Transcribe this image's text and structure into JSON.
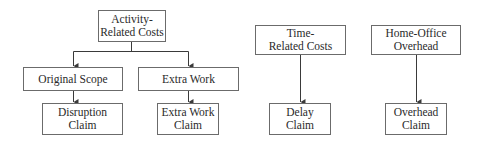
{
  "diagram": {
    "colors": {
      "line": "#3a3a3a",
      "border": "#6b6b6b",
      "text": "#2a2a2a",
      "background": "#ffffff"
    },
    "nodes": {
      "activity": {
        "lines": [
          "Activity-",
          "Related Costs"
        ]
      },
      "original_scope": {
        "lines": [
          "Original Scope"
        ]
      },
      "extra_work": {
        "lines": [
          "Extra Work"
        ]
      },
      "disruption_claim": {
        "lines": [
          "Disruption",
          "Claim"
        ]
      },
      "extra_work_claim": {
        "lines": [
          "Extra Work",
          "Claim"
        ]
      },
      "time_related": {
        "lines": [
          "Time-",
          "Related Costs"
        ]
      },
      "delay_claim": {
        "lines": [
          "Delay",
          "Claim"
        ]
      },
      "home_office": {
        "lines": [
          "Home-Office",
          "Overhead"
        ]
      },
      "overhead_claim": {
        "lines": [
          "Overhead",
          "Claim"
        ]
      }
    },
    "edges": [
      {
        "from": "activity",
        "to": "original_scope"
      },
      {
        "from": "activity",
        "to": "extra_work"
      },
      {
        "from": "original_scope",
        "to": "disruption_claim"
      },
      {
        "from": "extra_work",
        "to": "extra_work_claim"
      },
      {
        "from": "time_related",
        "to": "delay_claim"
      },
      {
        "from": "home_office",
        "to": "overhead_claim"
      }
    ]
  }
}
